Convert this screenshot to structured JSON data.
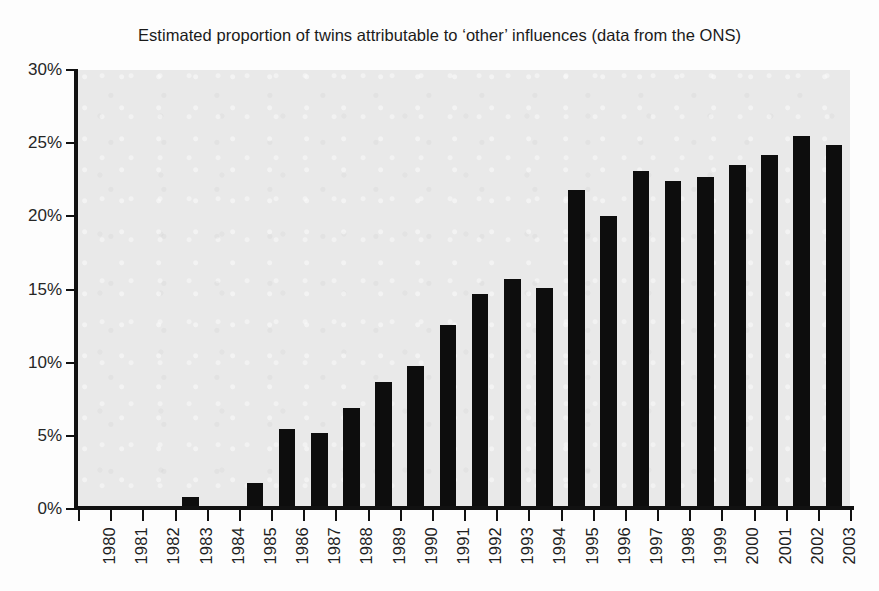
{
  "chart_data": {
    "type": "bar",
    "title": "Estimated proportion of twins attributable to ‘other’ influences (data from the ONS)",
    "xlabel": "",
    "ylabel": "",
    "ylim": [
      0,
      30
    ],
    "ytick_values": [
      0,
      5,
      10,
      15,
      20,
      25,
      30
    ],
    "ytick_labels": [
      "0%",
      "5%",
      "10%",
      "15%",
      "20%",
      "25%",
      "30%"
    ],
    "grid": false,
    "legend": "none",
    "bar_color": "#0d0d0d",
    "plot_background": "#e9e9e9",
    "categories": [
      "1980",
      "1981",
      "1982",
      "1983",
      "1984",
      "1985",
      "1986",
      "1987",
      "1988",
      "1989",
      "1990",
      "1991",
      "1992",
      "1993",
      "1994",
      "1995",
      "1996",
      "1997",
      "1998",
      "1999",
      "2000",
      "2001",
      "2002",
      "2003"
    ],
    "values": [
      0,
      0,
      0.2,
      0.85,
      0,
      1.8,
      5.5,
      5.2,
      6.9,
      8.7,
      9.8,
      12.6,
      14.7,
      15.7,
      15.1,
      21.8,
      20.0,
      23.1,
      22.4,
      22.7,
      23.5,
      24.2,
      25.5,
      24.9
    ],
    "value_unit": "%"
  }
}
